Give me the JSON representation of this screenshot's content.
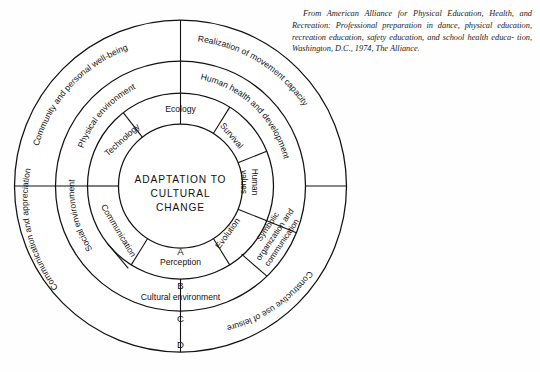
{
  "citation": {
    "line1": "From American Alliance for Physical Education, Health, and",
    "line2": "Recreation: Professional preparation in dance, physical education,",
    "line3": "recreation education, safety education, and school health educa-",
    "line4": "tion, Washington, D.C., 1974, The Alliance."
  },
  "diagram": {
    "center": {
      "line1": "ADAPTATION TO",
      "line2": "CULTURAL",
      "line3": "CHANGE"
    },
    "inner_ring": [
      {
        "label": "Ecology",
        "shaded": false
      },
      {
        "label": "Survival",
        "shaded": true
      },
      {
        "label": "Human values",
        "label_line1": "Human",
        "label_line2": "values",
        "shaded": false
      },
      {
        "label": "Evolution",
        "shaded": true
      },
      {
        "label": "Perception",
        "shaded": false
      },
      {
        "label": "Communication",
        "shaded": true
      },
      {
        "label": "Technology",
        "shaded": true
      }
    ],
    "middle_ring": [
      {
        "label": "Human health and development",
        "shaded": true
      },
      {
        "label": "Symbolic organization and communication",
        "label_line1": "Symbolic",
        "label_line2": "organization and",
        "label_line3": "communication",
        "shaded": true
      },
      {
        "label": "Cultural environment",
        "shaded": false
      },
      {
        "label": "Social environment",
        "shaded": true
      },
      {
        "label": "Physical environment",
        "shaded": true
      }
    ],
    "outer_ring": [
      {
        "label": "Realization of movement capacity",
        "shaded": true
      },
      {
        "label": "Constructive use of leisure",
        "shaded": true
      },
      {
        "label": "Communication and appreciation",
        "shaded": true
      },
      {
        "label": "Community and personal well-being",
        "shaded": true
      }
    ],
    "markers": [
      {
        "label": "A"
      },
      {
        "label": "B"
      },
      {
        "label": "C"
      },
      {
        "label": "D"
      }
    ],
    "colors": {
      "stroke": "#111111",
      "shade": "#d6d6d6",
      "background": "#ffffff"
    }
  }
}
